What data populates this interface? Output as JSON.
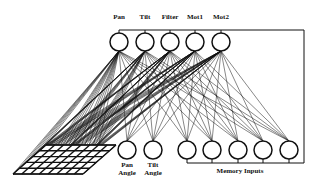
{
  "diagram": {
    "type": "neural-network",
    "output_nodes": [
      {
        "label": "Pan",
        "x": 119
      },
      {
        "label": "Tilt",
        "x": 145
      },
      {
        "label": "Filter",
        "x": 170
      },
      {
        "label": "Mot1",
        "x": 195
      },
      {
        "label": "Mot2",
        "x": 221
      }
    ],
    "input_nodes": [
      {
        "label_line1": "Pan",
        "label_line2": "Angle",
        "x": 127
      },
      {
        "label_line1": "Tilt",
        "label_line2": "Angle",
        "x": 153
      }
    ],
    "memory_nodes": [
      {
        "x": 187
      },
      {
        "x": 212
      },
      {
        "x": 238
      },
      {
        "x": 263
      },
      {
        "x": 289
      }
    ],
    "memory_label": "Memory Inputs",
    "grid": {
      "rows": 5,
      "cols": 8
    },
    "line_color": "#111111"
  }
}
